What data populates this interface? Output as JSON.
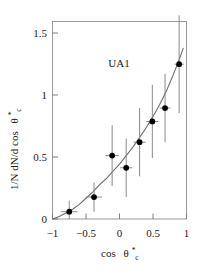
{
  "chart_data": {
    "type": "scatter",
    "title": "",
    "annotation": "UA1",
    "xlabel": "cos θ*c",
    "xlabel_parts": {
      "base": "cos",
      "theta": "θ",
      "sup": "*",
      "sub": "c"
    },
    "ylabel": "1/N dN/d cos θ*c",
    "ylabel_parts": {
      "base": "1/N dN/d cos",
      "theta": "θ",
      "sup": "*",
      "sub": "c"
    },
    "xlim": [
      -1,
      1
    ],
    "ylim": [
      0,
      1.62
    ],
    "xticks": [
      -1,
      -0.5,
      0,
      0.5,
      1
    ],
    "xticklabels": [
      "−1",
      "−0.5",
      "0",
      "0.5",
      "1"
    ],
    "yticks": [
      0,
      0.5,
      1,
      1.5
    ],
    "yticklabels": [
      "0",
      "0.5",
      "1",
      "1.5"
    ],
    "grid": false,
    "legend": null,
    "series": [
      {
        "name": "UA1 data",
        "style": "filled-circle-with-errorbars",
        "points": [
          {
            "x": -0.75,
            "y": 0.06,
            "xerr": 0.12,
            "yerr": 0.09
          },
          {
            "x": -0.38,
            "y": 0.18,
            "xerr": 0.12,
            "yerr": 0.12
          },
          {
            "x": -0.11,
            "y": 0.52,
            "xerr": 0.1,
            "yerr": 0.25
          },
          {
            "x": 0.1,
            "y": 0.42,
            "xerr": 0.09,
            "yerr": 0.24
          },
          {
            "x": 0.3,
            "y": 0.63,
            "xerr": 0.09,
            "yerr": 0.28
          },
          {
            "x": 0.49,
            "y": 0.8,
            "xerr": 0.09,
            "yerr": 0.3
          },
          {
            "x": 0.68,
            "y": 0.91,
            "xerr": 0.08,
            "yerr": 0.28
          },
          {
            "x": 0.89,
            "y": 1.27,
            "xerr": 0.07,
            "yerr": 0.4
          }
        ]
      },
      {
        "name": "fit curve",
        "style": "line",
        "comment": "smooth monotonically rising theory curve",
        "x": [
          -1.0,
          -0.9,
          -0.8,
          -0.7,
          -0.6,
          -0.5,
          -0.4,
          -0.3,
          -0.2,
          -0.1,
          0.0,
          0.1,
          0.2,
          0.3,
          0.4,
          0.5,
          0.6,
          0.7,
          0.8,
          0.9,
          0.95
        ],
        "y": [
          0.0,
          0.02,
          0.05,
          0.08,
          0.12,
          0.17,
          0.22,
          0.28,
          0.33,
          0.39,
          0.45,
          0.52,
          0.59,
          0.67,
          0.75,
          0.84,
          0.94,
          1.05,
          1.18,
          1.32,
          1.4
        ]
      }
    ]
  }
}
